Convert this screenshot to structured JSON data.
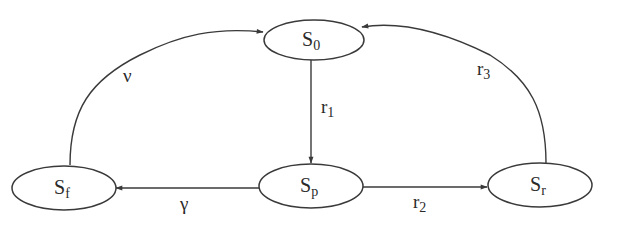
{
  "diagram": {
    "type": "state-transition",
    "nodes": [
      {
        "id": "S0",
        "base": "S",
        "sub": "0"
      },
      {
        "id": "Sp",
        "base": "S",
        "sub": "p"
      },
      {
        "id": "Sf",
        "base": "S",
        "sub": "f"
      },
      {
        "id": "Sr",
        "base": "S",
        "sub": "r"
      }
    ],
    "edges": [
      {
        "from": "S0",
        "to": "Sp",
        "label_base": "r",
        "label_sub": "1"
      },
      {
        "from": "Sp",
        "to": "Sf",
        "label_base": "γ",
        "label_sub": ""
      },
      {
        "from": "Sp",
        "to": "Sr",
        "label_base": "r",
        "label_sub": "2"
      },
      {
        "from": "Sf",
        "to": "S0",
        "label_base": "ν",
        "label_sub": ""
      },
      {
        "from": "Sr",
        "to": "S0",
        "label_base": "r",
        "label_sub": "3"
      }
    ],
    "colors": {
      "stroke": "#3a3a3a",
      "text": "#2a2a2a",
      "background": "#ffffff"
    }
  }
}
